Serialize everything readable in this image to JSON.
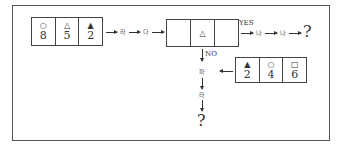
{
  "diagram": {
    "start_box": {
      "cells": [
        {
          "symbol": "○",
          "symbol_name": "circle",
          "value": "8"
        },
        {
          "symbol": "△",
          "symbol_name": "triangle-outline",
          "value": "5"
        },
        {
          "symbol": "▲",
          "symbol_name": "triangle-filled",
          "value": "2"
        }
      ]
    },
    "step_labels": [
      "라",
      "다"
    ],
    "decision_box": {
      "cells": [
        {
          "symbol": "",
          "value": ""
        },
        {
          "symbol": "△",
          "symbol_name": "triangle-outline",
          "value": ""
        },
        {
          "symbol": "",
          "value": ""
        }
      ]
    },
    "yes_label": "YES",
    "yes_steps": [
      "나",
      "나"
    ],
    "yes_result": "?",
    "no_label": "NO",
    "compare_box": {
      "cells": [
        {
          "symbol": "▲",
          "symbol_name": "triangle-filled",
          "value": "2"
        },
        {
          "symbol": "○",
          "symbol_name": "circle",
          "value": "4"
        },
        {
          "symbol": "□",
          "symbol_name": "square",
          "value": "6"
        }
      ]
    },
    "no_steps": [
      "파",
      "라"
    ],
    "no_result": "?"
  }
}
